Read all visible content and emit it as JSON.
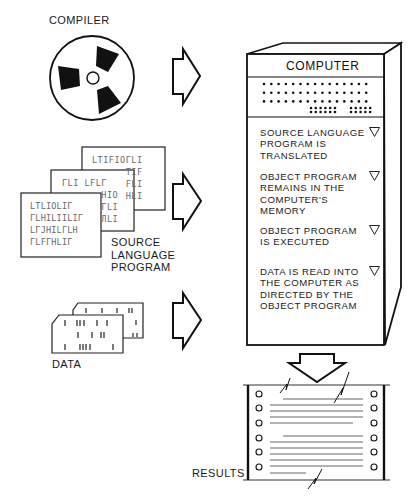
{
  "labels": {
    "compiler": "COMPILER",
    "source_program": "SOURCE\nLANGUAGE\nPROGRAM",
    "data": "DATA",
    "results": "RESULTS",
    "computer": "COMPUTER"
  },
  "steps": [
    {
      "text": "SOURCE LANGUAGE\nPROGRAM IS\nTRANSLATED"
    },
    {
      "text": "OBJECT PROGRAM\nREMAINS IN THE\nCOMPUTER'S\nMEMORY"
    },
    {
      "text": "OBJECT PROGRAM\nIS EXECUTED"
    },
    {
      "text": "DATA IS READ INTO\nTHE COMPUTER AS\nDIRECTED BY THE\nOBJECT PROGRAM"
    }
  ],
  "source_cards": {
    "back": "LTIFIOГLI\n      TIF\n      FLI\n      HLI",
    "middle": "ГLI LFLГ\n       HIO\n       ГLI\n       ЛLI",
    "front": "LTLIOLIГ\nГLHILIILIГ\nLГJHILГLH\nГLFГHLIГ"
  },
  "colors": {
    "ink": "#111111",
    "paper": "#ffffff",
    "faded_ink": "#6a6a6a"
  }
}
